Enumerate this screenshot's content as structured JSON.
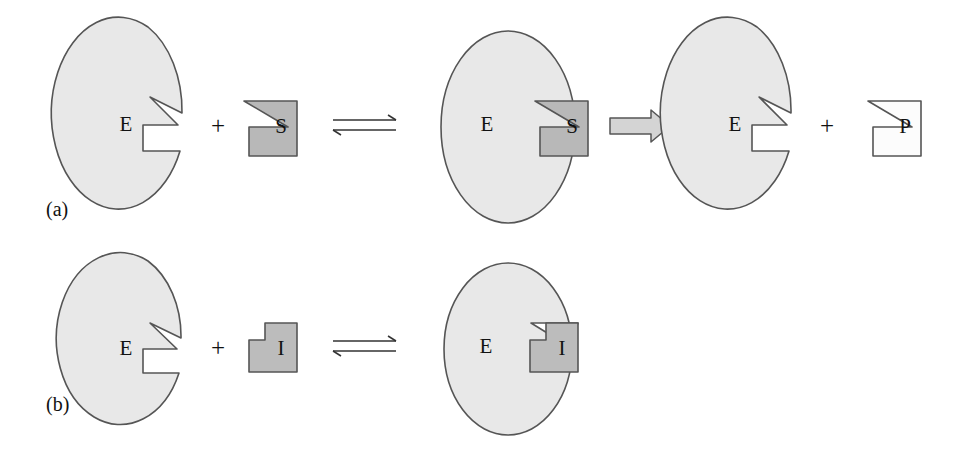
{
  "figure": {
    "caption_labels": {
      "panel_a": "(a)",
      "panel_b": "(b)"
    },
    "background_color": "#ffffff",
    "colors": {
      "enzyme_fill": "#e8e8e8",
      "substrate_fill": "#b8b8b8",
      "inhibitor_fill": "#bcbcbc",
      "product_fill": "#fcfcfc",
      "outline": "#555555",
      "block_arrow_fill": "#d4d4d4",
      "text": "#111111"
    }
  },
  "panel_a": {
    "label": "(a)",
    "equation_text": "E + S ⇌ ES → E + P",
    "steps": [
      {
        "id": "free-enzyme-a",
        "shape": "ellipse-with-notch",
        "letter": "E",
        "fill": "#e8e8e8",
        "meaning": "free enzyme with active site"
      },
      {
        "id": "plus-a-1",
        "shape": "plus",
        "letter": "+",
        "meaning": "plus sign"
      },
      {
        "id": "substrate",
        "shape": "zigzag-block",
        "letter": "S",
        "fill": "#b8b8b8",
        "meaning": "substrate"
      },
      {
        "id": "equilibrium-a",
        "shape": "equilibrium-arrow",
        "glyph": "⇌",
        "meaning": "reversible binding"
      },
      {
        "id": "es-complex",
        "shape": "ellipse-with-bound-block",
        "letter_enzyme": "E",
        "letter_ligand": "S",
        "meaning": "enzyme substrate complex"
      },
      {
        "id": "catalysis-arrow",
        "shape": "block-arrow",
        "glyph": "⇒",
        "meaning": "catalysis forms product"
      },
      {
        "id": "free-enzyme-a2",
        "shape": "ellipse-with-notch",
        "letter": "E",
        "fill": "#e8e8e8",
        "meaning": "regenerated free enzyme"
      },
      {
        "id": "plus-a-2",
        "shape": "plus",
        "letter": "+",
        "meaning": "plus sign"
      },
      {
        "id": "product",
        "shape": "zigzag-block",
        "letter": "P",
        "fill": "#fcfcfc",
        "meaning": "product"
      }
    ]
  },
  "panel_b": {
    "label": "(b)",
    "equation_text": "E + I ⇌ EI",
    "steps": [
      {
        "id": "free-enzyme-b",
        "shape": "ellipse-with-notch",
        "letter": "E",
        "fill": "#e8e8e8",
        "meaning": "free enzyme with active site"
      },
      {
        "id": "plus-b-1",
        "shape": "plus",
        "letter": "+",
        "meaning": "plus sign"
      },
      {
        "id": "inhibitor",
        "shape": "step-block",
        "letter": "I",
        "fill": "#bcbcbc",
        "meaning": "competitive inhibitor"
      },
      {
        "id": "equilibrium-b",
        "shape": "equilibrium-arrow",
        "glyph": "⇌",
        "meaning": "reversible binding"
      },
      {
        "id": "ei-complex",
        "shape": "ellipse-with-bound-block",
        "letter_enzyme": "E",
        "letter_ligand": "I",
        "meaning": "enzyme inhibitor complex"
      }
    ]
  }
}
